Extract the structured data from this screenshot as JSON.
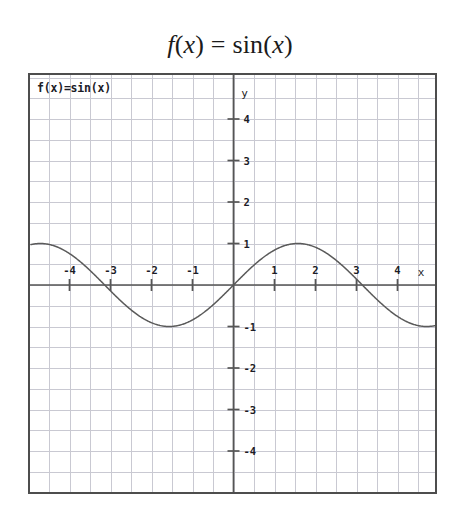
{
  "title": {
    "full_text": "f(x) = sin(x)",
    "var_f": "f",
    "paren_open_1": "(",
    "var_x_1": "x",
    "paren_close_1": ")",
    "equals": " = ",
    "func_sin": "sin",
    "paren_open_2": "(",
    "var_x_2": "x",
    "paren_close_2": ")"
  },
  "plot": {
    "function_label": "f(x)=sin(x)",
    "x_axis_label": "x",
    "y_axis_label": "y",
    "axis_color": "#555555",
    "grid_color": "#c9c9d2",
    "curve_color": "#5a5a5a",
    "frame_color": "#4d4d4d",
    "background": "#ffffff",
    "tick_label_color": "#1c1c26",
    "x_tick_labels": [
      "-4",
      "-3",
      "-2",
      "-1",
      "1",
      "2",
      "3",
      "4"
    ],
    "y_tick_labels": [
      "4",
      "3",
      "2",
      "1",
      "-1",
      "-2",
      "-3",
      "-4"
    ]
  },
  "chart_data": {
    "type": "line",
    "title": "f(x) = sin(x)",
    "xlabel": "x",
    "ylabel": "y",
    "legend": [
      "f(x)=sin(x)"
    ],
    "legend_position": "top-left-inside",
    "grid": true,
    "grid_step": 0.5,
    "xlim": [
      -5.0,
      5.0
    ],
    "ylim": [
      -5.15,
      5.15
    ],
    "xticks": [
      -4,
      -3,
      -2,
      -1,
      1,
      2,
      3,
      4
    ],
    "yticks": [
      4,
      3,
      2,
      1,
      -1,
      -2,
      -3,
      -4
    ],
    "expression": "sin(x)",
    "amplitude": 1,
    "period": 6.283185307179586,
    "series": [
      {
        "name": "f(x)=sin(x)",
        "x": [
          -5.0,
          -4.8,
          -4.6,
          -4.4,
          -4.2,
          -4.0,
          -3.8,
          -3.6,
          -3.4,
          -3.2,
          -3.0,
          -2.8,
          -2.6,
          -2.4,
          -2.2,
          -2.0,
          -1.8,
          -1.6,
          -1.4,
          -1.2,
          -1.0,
          -0.8,
          -0.6,
          -0.4,
          -0.2,
          0.0,
          0.2,
          0.4,
          0.6,
          0.8,
          1.0,
          1.2,
          1.4,
          1.6,
          1.8,
          2.0,
          2.2,
          2.4,
          2.6,
          2.8,
          3.0,
          3.2,
          3.4,
          3.6,
          3.8,
          4.0,
          4.2,
          4.4,
          4.6,
          4.8,
          5.0
        ],
        "y": [
          0.959,
          0.996,
          0.994,
          0.952,
          0.872,
          0.757,
          0.612,
          0.443,
          0.256,
          0.058,
          -0.141,
          -0.335,
          -0.516,
          -0.675,
          -0.808,
          -0.909,
          -0.974,
          -1.0,
          -0.985,
          -0.932,
          -0.841,
          -0.717,
          -0.565,
          -0.389,
          -0.199,
          0.0,
          0.199,
          0.389,
          0.565,
          0.717,
          0.841,
          0.932,
          0.985,
          1.0,
          0.974,
          0.909,
          0.808,
          0.675,
          0.516,
          0.335,
          0.141,
          -0.058,
          -0.256,
          -0.443,
          -0.612,
          -0.757,
          -0.872,
          -0.952,
          -0.994,
          -0.996,
          -0.959
        ]
      }
    ]
  }
}
